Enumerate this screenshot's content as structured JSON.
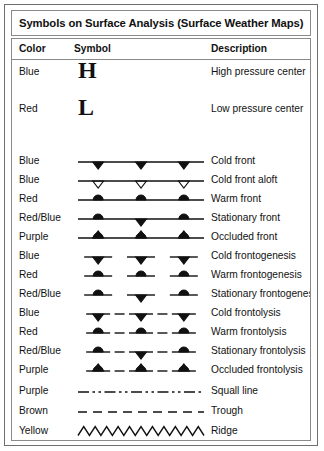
{
  "card": {
    "title": "Symbols on Surface Analysis (Surface Weather Maps)"
  },
  "table": {
    "headers": {
      "color": "Color",
      "symbol": "Symbol",
      "description": "Description"
    },
    "rows": [
      {
        "color": "Blue",
        "symbol": "letter-H",
        "description": "High pressure center"
      },
      {
        "color": "Red",
        "symbol": "letter-L",
        "description": "Low pressure center"
      },
      {
        "color": "Blue",
        "symbol": "cold-front",
        "description": "Cold front"
      },
      {
        "color": "Blue",
        "symbol": "cold-front-aloft",
        "description": "Cold front aloft"
      },
      {
        "color": "Red",
        "symbol": "warm-front",
        "description": "Warm front"
      },
      {
        "color": "Red/Blue",
        "symbol": "stationary-front",
        "description": "Stationary front"
      },
      {
        "color": "Purple",
        "symbol": "occluded-front",
        "description": "Occluded front"
      },
      {
        "color": "Blue",
        "symbol": "cold-frontogenesis",
        "description": "Cold frontogenesis"
      },
      {
        "color": "Red",
        "symbol": "warm-frontogenesis",
        "description": "Warm frontogenesis"
      },
      {
        "color": "Red/Blue",
        "symbol": "stationary-frontogenesis",
        "description": "Stationary frontogenesis"
      },
      {
        "color": "Blue",
        "symbol": "cold-frontolysis",
        "description": "Cold frontolysis"
      },
      {
        "color": "Red",
        "symbol": "warm-frontolysis",
        "description": "Warm frontolysis"
      },
      {
        "color": "Red/Blue",
        "symbol": "stationary-frontolysis",
        "description": "Stationary frontolysis"
      },
      {
        "color": "Purple",
        "symbol": "occluded-frontolysis",
        "description": "Occluded frontolysis"
      },
      {
        "color": "Purple",
        "symbol": "squall-line",
        "description": "Squall line"
      },
      {
        "color": "Brown",
        "symbol": "trough",
        "description": "Trough"
      },
      {
        "color": "Yellow",
        "symbol": "ridge",
        "description": "Ridge"
      }
    ]
  },
  "style": {
    "ink": "#111111",
    "border": "#8a8a8a",
    "outer_border": "#6f6f6f",
    "background": "#ffffff"
  }
}
